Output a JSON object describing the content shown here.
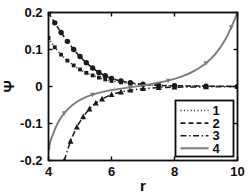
{
  "chart_data": {
    "type": "line",
    "title": "",
    "xlabel": "r",
    "ylabel": "Ψ",
    "xlim": [
      4,
      10
    ],
    "ylim": [
      -0.2,
      0.2
    ],
    "xticks": [
      4,
      6,
      8,
      10
    ],
    "xtick_labels": [
      "4",
      "6",
      "8",
      "10"
    ],
    "yticks": [
      -0.2,
      -0.1,
      0,
      0.1,
      0.2
    ],
    "ytick_labels": [
      "-0.2",
      "-0.1",
      "0",
      "0.1",
      "0.2"
    ],
    "grid": false,
    "legend_position": "lower right",
    "legend_entries": [
      {
        "label": "1",
        "style": "dotted",
        "marker": "square",
        "color": "#1a1a1a"
      },
      {
        "label": "2",
        "style": "dashed",
        "marker": "circle",
        "color": "#1a1a1a"
      },
      {
        "label": "3",
        "style": "dashdot",
        "marker": "triangle",
        "color": "#1a1a1a"
      },
      {
        "label": "4",
        "style": "solid",
        "marker": "triangle-down",
        "color": "#7d7d7d"
      }
    ],
    "series": [
      {
        "name": "1",
        "label": "1",
        "style": "dotted",
        "marker": "square",
        "color": "#1a1a1a",
        "x": [
          4.0,
          4.2,
          4.4,
          4.6,
          4.8,
          5.0,
          5.2,
          5.4,
          5.6,
          5.8,
          6.0,
          6.3,
          6.6,
          7.0,
          7.5,
          8.0,
          9.0,
          10.0
        ],
        "y": [
          0.131,
          0.106,
          0.086,
          0.07,
          0.057,
          0.046,
          0.037,
          0.03,
          0.024,
          0.019,
          0.015,
          0.011,
          0.008,
          0.005,
          0.003,
          0.002,
          0.001,
          0.0
        ]
      },
      {
        "name": "2",
        "label": "2",
        "style": "dashed",
        "marker": "circle",
        "color": "#1a1a1a",
        "x": [
          4.0,
          4.2,
          4.4,
          4.6,
          4.8,
          5.0,
          5.2,
          5.4,
          5.6,
          5.8,
          6.0,
          6.3,
          6.6,
          7.0,
          7.5,
          8.0,
          9.0,
          10.0
        ],
        "y": [
          0.2,
          0.172,
          0.146,
          0.122,
          0.1,
          0.081,
          0.064,
          0.05,
          0.038,
          0.029,
          0.022,
          0.015,
          0.01,
          0.006,
          0.003,
          0.002,
          0.001,
          0.0
        ]
      },
      {
        "name": "3",
        "label": "3",
        "style": "dashdot",
        "marker": "triangle",
        "color": "#1a1a1a",
        "x": [
          4.5,
          4.7,
          4.9,
          5.1,
          5.3,
          5.5,
          5.7,
          6.0,
          6.3,
          6.6,
          7.0,
          7.5,
          8.0,
          9.0,
          10.0
        ],
        "y": [
          -0.2,
          -0.148,
          -0.11,
          -0.082,
          -0.061,
          -0.045,
          -0.034,
          -0.022,
          -0.015,
          -0.01,
          -0.006,
          -0.003,
          -0.002,
          -0.001,
          0.0
        ]
      },
      {
        "name": "4",
        "label": "4",
        "style": "solid",
        "marker": "triangle-down",
        "color": "#7d7d7d",
        "x": [
          4.0,
          4.1,
          4.3,
          4.5,
          4.8,
          5.1,
          5.4,
          5.8,
          6.2,
          6.6,
          7.0,
          7.4,
          7.8,
          8.2,
          8.6,
          9.0,
          9.3,
          9.6,
          9.8,
          10.0
        ],
        "y": [
          -0.17,
          -0.138,
          -0.098,
          -0.072,
          -0.047,
          -0.032,
          -0.022,
          -0.013,
          -0.007,
          -0.002,
          0.003,
          0.009,
          0.016,
          0.026,
          0.041,
          0.063,
          0.088,
          0.125,
          0.16,
          0.2
        ]
      }
    ]
  }
}
